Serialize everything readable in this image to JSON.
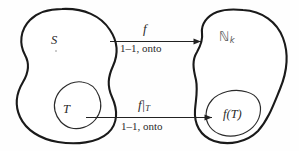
{
  "diagram": {
    "type": "set-mapping-diagram",
    "background_color": "#fefefe",
    "stroke_color": "#1a1a1a",
    "domain_set": {
      "label": "S",
      "subset": {
        "label": "T"
      }
    },
    "codomain_set": {
      "label_base": "ℕ",
      "label_subscript": "k",
      "subset": {
        "label": "f(T)"
      }
    },
    "arrows": [
      {
        "name": "top-arrow",
        "label_above": "f",
        "label_below": "1–1, onto"
      },
      {
        "name": "bottom-arrow",
        "label_above_base": "f",
        "label_above_bar": "|",
        "label_above_subscript": "T",
        "label_below": "1–1, onto"
      }
    ]
  }
}
